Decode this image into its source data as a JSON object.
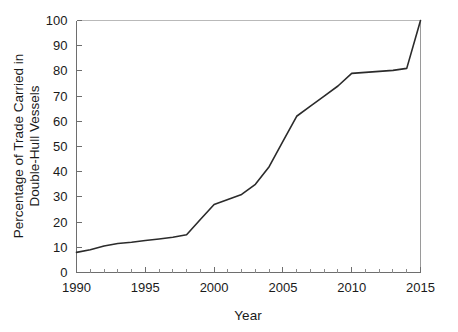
{
  "chart_data": {
    "type": "line",
    "title": "",
    "xlabel": "Year",
    "ylabel": "Percentage of Trade Carried in Double-Hull Vessels",
    "ylabel_lines": [
      "Percentage of Trade Carried in",
      "Double-Hull Vessels"
    ],
    "xlim": [
      1990,
      2015
    ],
    "ylim": [
      0,
      100
    ],
    "grid": false,
    "legend": null,
    "legend_position": "none",
    "x_major_ticks": [
      1990,
      1995,
      2000,
      2005,
      2010,
      2015
    ],
    "x_major_tick_labels": [
      "1990",
      "1995",
      "2000",
      "2005",
      "2010",
      "2015"
    ],
    "x_minor_tick_step": 1,
    "y_major_ticks": [
      0,
      10,
      20,
      30,
      40,
      50,
      60,
      70,
      80,
      90,
      100
    ],
    "y_major_tick_labels": [
      "0",
      "10",
      "20",
      "30",
      "40",
      "50",
      "60",
      "70",
      "80",
      "90",
      "100"
    ],
    "series": [
      {
        "name": "Percentage of Trade Carried in Double-Hull Vessels",
        "color": "#2b2b2b",
        "x": [
          1990,
          1991,
          1992,
          1993,
          1994,
          1995,
          1996,
          1997,
          1998,
          1999,
          2000,
          2001,
          2002,
          2003,
          2004,
          2005,
          2006,
          2007,
          2008,
          2009,
          2010,
          2011,
          2012,
          2013,
          2014,
          2015
        ],
        "values": [
          8,
          9,
          10.5,
          11.5,
          12,
          12.7,
          13.3,
          14,
          15,
          21,
          27,
          29,
          31,
          35,
          42,
          52,
          62,
          66,
          70,
          74,
          79,
          79.4,
          79.8,
          80.2,
          81,
          100
        ]
      }
    ]
  },
  "colors": {
    "line": "#2b2b2b",
    "axis": "#6e6e6e",
    "frame_top": "#b9b9b9",
    "text": "#1a1a1a",
    "background": "#ffffff"
  }
}
